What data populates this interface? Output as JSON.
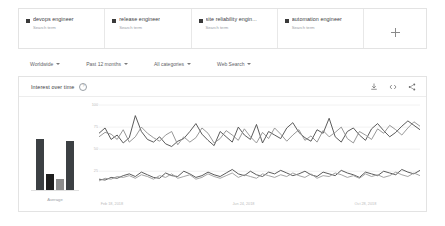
{
  "terms": {
    "items": [
      {
        "label": "devops engineer",
        "sub": "Search term"
      },
      {
        "label": "release engineer",
        "sub": "Search term"
      },
      {
        "label": "site reliability engin...",
        "sub": "Search term"
      },
      {
        "label": "automation engineer",
        "sub": "Search term"
      }
    ],
    "add_label": "+"
  },
  "filters": [
    {
      "label": "Worldwide"
    },
    {
      "label": "Past 12 months"
    },
    {
      "label": "All categories"
    },
    {
      "label": "Web Search"
    }
  ],
  "chart_card": {
    "title": "Interest over time",
    "info_icon": "info-icon",
    "actions": [
      {
        "name": "download-icon"
      },
      {
        "name": "embed-icon"
      },
      {
        "name": "share-icon"
      }
    ]
  },
  "chart_data": {
    "type": "line",
    "title": "Interest over time",
    "xlabel": "",
    "ylabel": "",
    "ylim": [
      0,
      100
    ],
    "grid": true,
    "legend_position": "top",
    "yticks": [
      100,
      75,
      50,
      25
    ],
    "xticks": [
      "Feb 18, 2018",
      "Jun 24, 2018",
      "Oct 28, 2018"
    ],
    "xtick_positions": [
      0.04,
      0.45,
      0.83
    ],
    "average_panel": {
      "label": "Average",
      "values": [
        72,
        24,
        17,
        70
      ]
    },
    "series": [
      {
        "name": "devops engineer",
        "color": "#4a4a4a",
        "values": [
          68,
          74,
          61,
          66,
          57,
          63,
          88,
          70,
          61,
          58,
          64,
          56,
          53,
          59,
          62,
          70,
          79,
          67,
          60,
          54,
          70,
          64,
          58,
          75,
          66,
          61,
          78,
          57,
          70,
          66,
          62,
          74,
          80,
          69,
          63,
          59,
          72,
          68,
          85,
          64,
          58,
          70,
          74,
          66,
          60,
          73,
          79,
          71,
          64,
          69,
          76,
          82,
          77,
          72
        ]
      },
      {
        "name": "release engineer",
        "color": "#8c8c8c",
        "values": [
          64,
          69,
          67,
          61,
          72,
          58,
          64,
          75,
          68,
          63,
          59,
          66,
          70,
          55,
          64,
          58,
          63,
          74,
          68,
          57,
          62,
          71,
          66,
          60,
          73,
          64,
          57,
          69,
          62,
          74,
          67,
          59,
          66,
          72,
          60,
          65,
          58,
          71,
          64,
          69,
          75,
          62,
          57,
          70,
          66,
          61,
          73,
          68,
          77,
          72,
          66,
          74,
          81,
          76
        ]
      },
      {
        "name": "site reliability engin...",
        "color": "#4a4a4a",
        "values": [
          16,
          15,
          18,
          17,
          20,
          22,
          19,
          24,
          21,
          18,
          17,
          23,
          20,
          19,
          25,
          22,
          18,
          20,
          24,
          21,
          19,
          23,
          27,
          22,
          20,
          25,
          21,
          19,
          24,
          22,
          26,
          23,
          20,
          22,
          25,
          21,
          19,
          24,
          22,
          20,
          26,
          23,
          21,
          18,
          24,
          22,
          20,
          25,
          23,
          21,
          27,
          24,
          22,
          26
        ]
      },
      {
        "name": "automation engineer",
        "color": "#9a9a9a",
        "values": [
          14,
          17,
          16,
          19,
          18,
          20,
          17,
          21,
          19,
          16,
          20,
          18,
          22,
          17,
          19,
          21,
          16,
          18,
          22,
          19,
          17,
          20,
          23,
          18,
          21,
          19,
          17,
          22,
          20,
          18,
          21,
          19,
          23,
          20,
          18,
          22,
          17,
          20,
          19,
          23,
          21,
          18,
          20,
          17,
          22,
          19,
          21,
          18,
          20,
          24,
          21,
          19,
          23,
          20
        ]
      }
    ]
  }
}
